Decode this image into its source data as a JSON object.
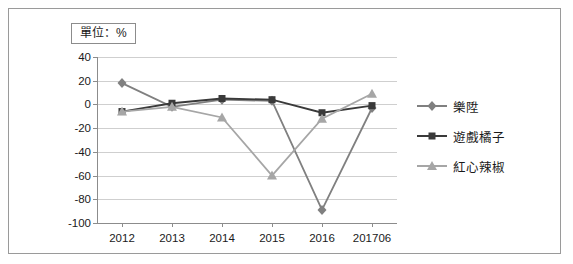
{
  "unit_note": "單位：%",
  "chart_data": {
    "type": "line",
    "title": "",
    "subtitle": "",
    "xlabel": "",
    "ylabel": "",
    "unit": "%",
    "categories": [
      "2012",
      "2013",
      "2014",
      "2015",
      "2016",
      "201706"
    ],
    "ylim": [
      -100,
      40
    ],
    "yticks": [
      40,
      20,
      0,
      -20,
      -40,
      -60,
      -80,
      -100
    ],
    "ytick_labels": [
      "40",
      "20",
      "0",
      "-20",
      "-40",
      "-60",
      "-80",
      "-100"
    ],
    "grid": true,
    "legend_position": "right",
    "series": [
      {
        "name": "樂陞",
        "marker": "diamond",
        "color": "#808080",
        "values": [
          18,
          -2,
          4,
          3,
          -89,
          -3
        ]
      },
      {
        "name": "遊戲橘子",
        "marker": "square",
        "color": "#3a3a3a",
        "values": [
          -6,
          1,
          5,
          4,
          -7,
          -1
        ]
      },
      {
        "name": "紅心辣椒",
        "marker": "triangle",
        "color": "#a6a6a6",
        "values": [
          -6,
          -2,
          -11,
          -60,
          -12,
          9
        ]
      }
    ]
  }
}
